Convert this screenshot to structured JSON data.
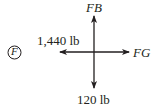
{
  "diagram": {
    "joint_label": "F",
    "forces": {
      "up": "FB",
      "right": "FG",
      "left": "1,440 lb",
      "down": "120 lb"
    },
    "stroke_color": "#231f20"
  }
}
